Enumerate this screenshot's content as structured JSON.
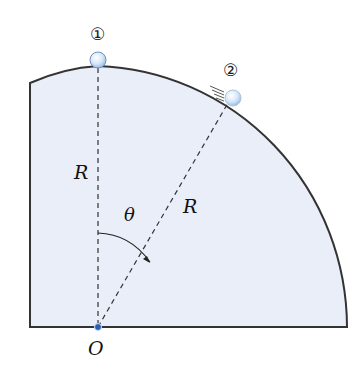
{
  "figure": {
    "title": "",
    "labels": {
      "ball1": "①",
      "ball2": "②",
      "radius_vertical": "R",
      "radius_inclined": "R",
      "angle": "θ",
      "origin": "O"
    },
    "colors": {
      "fill": "#e8eef8",
      "outline": "#333333",
      "ball": "#cfe2f7",
      "ball_highlight": "#ffffff",
      "origin_dot": "#2a5fb0"
    }
  }
}
